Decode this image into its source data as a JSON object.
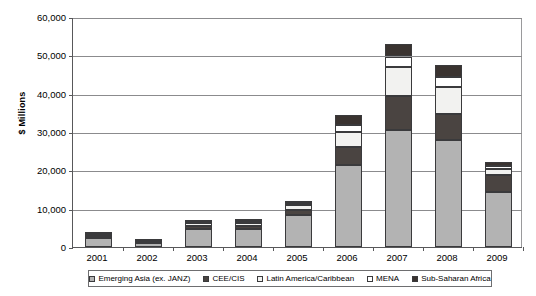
{
  "chart_data": {
    "type": "bar",
    "subtype": "stacked-vertical",
    "title": "",
    "xlabel": "",
    "ylabel": "$ Millions",
    "ylim": [
      0,
      60000
    ],
    "ytick_step": 10000,
    "grid": true,
    "legend_position": "bottom",
    "categories": [
      "2001",
      "2002",
      "2003",
      "2004",
      "2005",
      "2006",
      "2007",
      "2008",
      "2009"
    ],
    "ytick_labels": [
      "0",
      "10,000",
      "20,000",
      "30,000",
      "40,000",
      "50,000",
      "60,000"
    ],
    "ytick_values": [
      0,
      10000,
      20000,
      30000,
      40000,
      50000,
      60000
    ],
    "series": [
      {
        "name": "Emerging Asia (ex. JANZ)",
        "color": "#b3b3b3",
        "values": [
          2300,
          1000,
          4800,
          4600,
          8300,
          21500,
          30500,
          28000,
          14300
        ]
      },
      {
        "name": "CEE/CIS",
        "color": "#4a4441",
        "values": [
          300,
          200,
          700,
          1000,
          1300,
          4500,
          9000,
          6800,
          4500
        ]
      },
      {
        "name": "Latin America/Caribbean",
        "color": "#f2f2f0",
        "values": [
          500,
          200,
          800,
          700,
          1300,
          4000,
          7500,
          7000,
          1600
        ]
      },
      {
        "name": "MENA",
        "color": "#ffffff",
        "values": [
          200,
          100,
          300,
          400,
          500,
          1800,
          2700,
          2600,
          700
        ]
      },
      {
        "name": "Sub-Saharan Africa",
        "color": "#3a3330",
        "values": [
          300,
          200,
          400,
          400,
          700,
          2700,
          3300,
          3100,
          1100
        ]
      }
    ],
    "totals": [
      3600,
      1700,
      7000,
      7100,
      12100,
      34500,
      53000,
      47500,
      22200
    ]
  },
  "legend": {
    "items": [
      {
        "label": "Emerging Asia (ex. JANZ)",
        "swatch": "legend-swatch-emerging-asia"
      },
      {
        "label": "CEE/CIS",
        "swatch": "legend-swatch-cee-cis"
      },
      {
        "label": "Latin America/Caribbean",
        "swatch": "legend-swatch-latam"
      },
      {
        "label": "MENA",
        "swatch": "legend-swatch-mena"
      },
      {
        "label": "Sub-Saharan Africa",
        "swatch": "legend-swatch-ssa"
      }
    ]
  }
}
